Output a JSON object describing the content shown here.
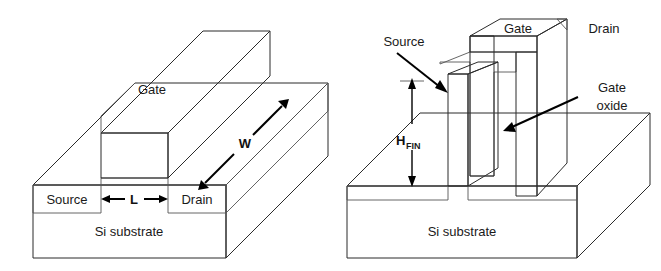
{
  "figure": {
    "background_color": "#ffffff"
  },
  "palette": {
    "substrate_front": "#ffffff",
    "substrate_top": "#d2d2d2",
    "substrate_side": "#c0c0c0",
    "source_drain_band": "#a8a8a8",
    "fin_oxide_band": "#8a8a8a",
    "gate_top": "#c4c4c4",
    "gate_front": "#a9a9a9",
    "gate_side": "#8f8f8f",
    "gate_dark_top": "#7f7f7f",
    "gate_dark_front": "#6e6e6e",
    "gate_dark_side": "#5c5c5c",
    "fin_front": "#ffffff",
    "fin_top": "#e8e8e8",
    "fin_side": "#c8c8c8",
    "oxide_white": "#ffffff",
    "outline": "#2b2b2b",
    "text": "#1a1a1a",
    "arrow": "#000000"
  },
  "left_diagram": {
    "name": "planar-mosfet",
    "labels": {
      "gate": "Gate",
      "source": "Source",
      "drain": "Drain",
      "substrate": "Si substrate",
      "channel_length": "L",
      "channel_width": "W"
    }
  },
  "right_diagram": {
    "name": "finfet",
    "labels": {
      "gate": "Gate",
      "source": "Source",
      "drain": "Drain",
      "substrate": "Si substrate",
      "gate_oxide_line1": "Gate",
      "gate_oxide_line2": "oxide",
      "fin_height_base": "H",
      "fin_height_sub": "FIN"
    }
  }
}
